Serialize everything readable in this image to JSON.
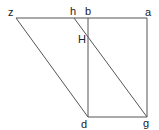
{
  "diagram": {
    "type": "geometric-figure",
    "colors": {
      "line": "#555555",
      "label": "#222222",
      "background": "#ffffff"
    },
    "points": {
      "z": {
        "label": "z",
        "x": 16,
        "y": 18
      },
      "h": {
        "label": "h",
        "x": 74,
        "y": 18
      },
      "b": {
        "label": "b",
        "x": 88,
        "y": 18
      },
      "a": {
        "label": "a",
        "x": 147,
        "y": 18
      },
      "H": {
        "label": "H",
        "x": 88,
        "y": 37
      },
      "d": {
        "label": "d",
        "x": 88,
        "y": 117
      },
      "g": {
        "label": "g",
        "x": 147,
        "y": 117
      }
    },
    "segments": [
      {
        "from": "z",
        "to": "a"
      },
      {
        "from": "b",
        "to": "d"
      },
      {
        "from": "a",
        "to": "g"
      },
      {
        "from": "d",
        "to": "g"
      },
      {
        "from": "z",
        "to": "d"
      },
      {
        "from": "h",
        "to": "g"
      }
    ],
    "labels": {
      "z": "z",
      "h": "h",
      "b": "b",
      "a": "a",
      "H": "H",
      "d": "d",
      "g": "g"
    }
  }
}
